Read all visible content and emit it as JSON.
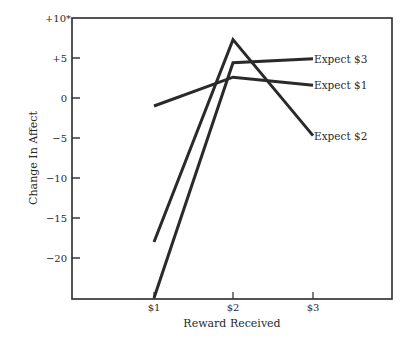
{
  "chart_data": {
    "type": "line",
    "title": "",
    "xlabel": "Reward Received",
    "ylabel": "Change In Affect",
    "categories": [
      "$1",
      "$2",
      "$3"
    ],
    "series": [
      {
        "name": "Expect $3",
        "values": [
          -25,
          4.4,
          4.9
        ]
      },
      {
        "name": "Expect $1",
        "values": [
          -1,
          2.6,
          1.6
        ]
      },
      {
        "name": "Expect $2",
        "values": [
          -18,
          7.3,
          -4.7
        ]
      }
    ],
    "ylim": [
      -25,
      10
    ],
    "yticks": [
      10,
      5,
      0,
      -5,
      -10,
      -15,
      -20
    ],
    "ytick_labels": [
      "+10*",
      "+5",
      "0",
      "−5",
      "−10",
      "−15",
      "−20"
    ],
    "grid": false,
    "legend_position": "inline-right",
    "line_color": "#2a2a2a"
  }
}
